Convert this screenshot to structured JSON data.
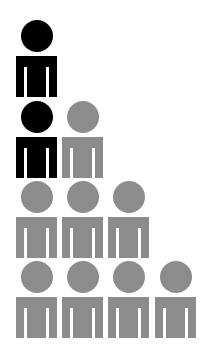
{
  "chart_data": {
    "type": "pictograph",
    "title": "",
    "rows": [
      {
        "row": 1,
        "count": 1,
        "colors": [
          "black"
        ]
      },
      {
        "row": 2,
        "count": 2,
        "colors": [
          "black",
          "gray"
        ]
      },
      {
        "row": 3,
        "count": 3,
        "colors": [
          "gray",
          "gray",
          "gray"
        ]
      },
      {
        "row": 4,
        "count": 4,
        "colors": [
          "gray",
          "gray",
          "gray",
          "gray"
        ]
      }
    ],
    "totals": {
      "icons": 10,
      "black": 2,
      "gray": 8
    }
  },
  "colors": {
    "black": "#000000",
    "gray": "#8c8c8c",
    "background": "#ffffff"
  },
  "layout": {
    "cols_x": [
      16,
      62,
      108,
      155
    ],
    "rows_y": [
      20,
      101,
      181,
      261
    ]
  }
}
